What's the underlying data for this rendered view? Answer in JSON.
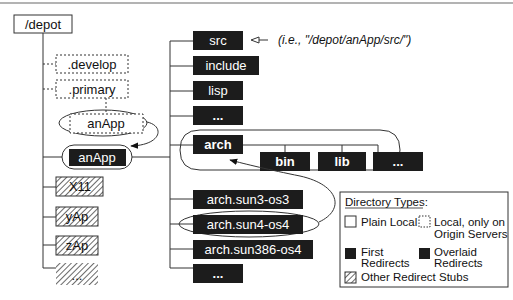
{
  "diagram": {
    "root": "/depot",
    "left_column": {
      "origin_dirs": [
        ".develop",
        ".primary"
      ],
      "origin_app": "anApp",
      "first_redirect": "anApp",
      "stubs": [
        "X11",
        "yAp",
        "zAp",
        "..."
      ]
    },
    "right_column": {
      "items": [
        "src",
        "include",
        "lisp",
        "...",
        "arch",
        "arch.sun3-os3",
        "arch.sun4-os4",
        "arch.sun386-os4",
        "..."
      ],
      "arch_children": [
        "bin",
        "lib",
        "..."
      ],
      "src_annotation": "(i.e., \"/depot/anApp/src/\")"
    },
    "legend": {
      "title": "Directory Types:",
      "plain_local": "Plain Local",
      "local_origin_line1": "Local, only on",
      "local_origin_line2": "Origin Servers",
      "first_line1": "First",
      "first_line2": "Redirects",
      "overlaid_line1": "Overlaid",
      "overlaid_line2": "Redirects",
      "other": "Other Redirect Stubs"
    },
    "colors": {
      "redirect_fill": "#1c1c1c",
      "line": "#333333",
      "top_rule": "#9a9a9a"
    }
  }
}
